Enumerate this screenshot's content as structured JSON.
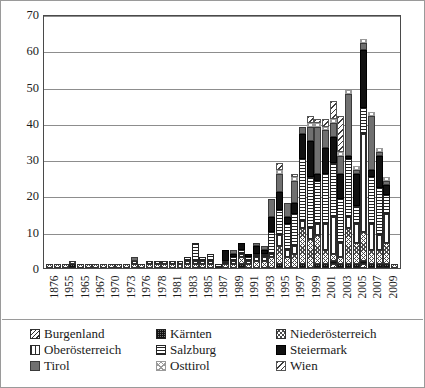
{
  "chart_data": {
    "type": "bar",
    "stacked": true,
    "title": "",
    "xlabel": "",
    "ylabel": "",
    "ylim": [
      0,
      70
    ],
    "yticks": [
      0,
      10,
      20,
      30,
      40,
      50,
      60,
      70
    ],
    "grid": true,
    "legend_position": "bottom",
    "legend_columns": 3,
    "categories": [
      "1876",
      "1955",
      "1963",
      "1965",
      "1966",
      "1967",
      "1968",
      "1970",
      "1971",
      "1973",
      "1975",
      "1976",
      "1977",
      "1978",
      "1980",
      "1981",
      "1982",
      "1983",
      "1984",
      "1985",
      "1986",
      "1987",
      "1988",
      "1989",
      "1990",
      "1991",
      "1992",
      "1993",
      "1994",
      "1995",
      "1996",
      "1997",
      "1998",
      "1999",
      "2000",
      "2001",
      "2002",
      "2003",
      "2004",
      "2005",
      "2006",
      "2007",
      "2008",
      "2009",
      "2010",
      "2011"
    ],
    "tick_labels": [
      "1876",
      "",
      "1955",
      "",
      "1965",
      "",
      "1967",
      "",
      "1970",
      "",
      "1973",
      "",
      "1976",
      "",
      "1978",
      "",
      "1981",
      "",
      "1983",
      "",
      "1985",
      "",
      "1987",
      "",
      "1989",
      "",
      "1991",
      "",
      "1993",
      "",
      "1995",
      "",
      "1997",
      "",
      "1999",
      "",
      "2001",
      "",
      "2003",
      "",
      "2005",
      "",
      "2007",
      "",
      "2009",
      "",
      "2011"
    ],
    "axis_tick_labels": [
      "1876",
      "1955",
      "1965",
      "1967",
      "1970",
      "1973",
      "1976",
      "1978",
      "1981",
      "1983",
      "1985",
      "1987",
      "1989",
      "1991",
      "1993",
      "1995",
      "1997",
      "1999",
      "2001",
      "2003",
      "2005",
      "2007",
      "2009",
      "2011"
    ],
    "series": [
      {
        "name": "Burgenland",
        "pattern": "p-burgenland",
        "values": [
          0,
          0,
          0,
          0,
          0,
          0,
          0,
          0,
          0,
          0,
          0,
          0,
          0,
          0,
          0,
          0,
          0,
          0,
          0,
          0,
          0,
          0,
          0,
          0,
          0,
          0,
          0,
          0,
          0,
          0,
          0,
          0,
          0,
          0,
          0,
          0,
          0,
          1,
          0,
          0,
          0,
          1,
          0,
          0,
          0,
          0
        ]
      },
      {
        "name": "Kärnten",
        "pattern": "p-kaernten",
        "values": [
          0,
          0,
          0,
          1,
          0,
          0,
          0,
          0,
          0,
          0,
          0,
          0,
          0,
          0,
          0,
          0,
          0,
          0,
          0,
          0,
          0,
          0,
          0,
          0,
          0,
          1,
          0,
          0,
          0,
          0,
          1,
          0,
          0,
          1,
          0,
          1,
          1,
          1,
          1,
          1,
          1,
          1,
          1,
          1,
          1,
          0
        ]
      },
      {
        "name": "Niederösterreich",
        "pattern": "p-niederoesterreich",
        "values": [
          1,
          1,
          1,
          1,
          1,
          1,
          1,
          1,
          1,
          1,
          1,
          1,
          1,
          1,
          1,
          1,
          1,
          1,
          1,
          1,
          1,
          1,
          0,
          1,
          1,
          2,
          1,
          2,
          2,
          3,
          5,
          3,
          4,
          10,
          8,
          8,
          4,
          2,
          2,
          10,
          6,
          8,
          4,
          4,
          6,
          1
        ]
      },
      {
        "name": "Oberösterreich",
        "pattern": "p-oberoesterreich",
        "values": [
          0,
          0,
          0,
          0,
          0,
          0,
          0,
          0,
          0,
          0,
          0,
          1,
          0,
          1,
          1,
          1,
          1,
          1,
          1,
          1,
          1,
          1,
          0,
          0,
          1,
          1,
          1,
          1,
          1,
          1,
          3,
          2,
          2,
          2,
          3,
          3,
          7,
          10,
          4,
          3,
          5,
          27,
          7,
          4,
          8,
          0
        ]
      },
      {
        "name": "Salzburg",
        "pattern": "p-salzburg",
        "values": [
          0,
          0,
          0,
          0,
          0,
          0,
          0,
          0,
          0,
          0,
          0,
          0,
          0,
          0,
          0,
          0,
          0,
          0,
          1,
          5,
          1,
          2,
          1,
          1,
          1,
          1,
          1,
          1,
          1,
          6,
          7,
          7,
          9,
          17,
          14,
          12,
          14,
          15,
          12,
          16,
          5,
          7,
          13,
          13,
          5,
          0
        ]
      },
      {
        "name": "Steiermark",
        "pattern": "p-steiermark",
        "values": [
          0,
          0,
          0,
          0,
          0,
          0,
          0,
          0,
          0,
          0,
          0,
          0,
          0,
          0,
          0,
          0,
          0,
          0,
          0,
          0,
          0,
          0,
          0,
          3,
          1,
          2,
          1,
          2,
          1,
          4,
          5,
          2,
          3,
          7,
          10,
          2,
          7,
          7,
          7,
          1,
          9,
          16,
          2,
          9,
          3,
          0
        ]
      },
      {
        "name": "Tirol",
        "pattern": "p-tirol",
        "values": [
          0,
          0,
          0,
          0,
          0,
          0,
          0,
          0,
          0,
          0,
          0,
          1,
          0,
          0,
          0,
          0,
          0,
          0,
          0,
          0,
          0,
          0,
          0,
          0,
          1,
          0,
          0,
          1,
          1,
          5,
          5,
          4,
          6,
          2,
          4,
          13,
          5,
          4,
          5,
          17,
          1,
          2,
          15,
          1,
          1,
          0
        ]
      },
      {
        "name": "Osttirol",
        "pattern": "p-osttirol",
        "values": [
          0,
          0,
          0,
          0,
          0,
          0,
          0,
          0,
          0,
          0,
          0,
          0,
          0,
          0,
          0,
          0,
          0,
          0,
          0,
          0,
          0,
          0,
          0,
          0,
          0,
          0,
          0,
          0,
          0,
          0,
          1,
          0,
          1,
          0,
          1,
          1,
          1,
          1,
          1,
          1,
          1,
          1,
          1,
          1,
          1,
          0
        ]
      },
      {
        "name": "Wien",
        "pattern": "p-wien",
        "values": [
          0,
          0,
          0,
          0,
          0,
          0,
          0,
          0,
          0,
          0,
          0,
          0,
          0,
          0,
          0,
          0,
          0,
          0,
          0,
          0,
          0,
          0,
          0,
          0,
          0,
          0,
          0,
          0,
          0,
          0,
          2,
          0,
          1,
          0,
          2,
          1,
          2,
          5,
          10,
          0,
          0,
          0,
          0,
          0,
          0,
          0
        ]
      }
    ],
    "totals": [
      1,
      1,
      1,
      2,
      1,
      1,
      1,
      1,
      1,
      1,
      1,
      3,
      1,
      2,
      2,
      3,
      3,
      3,
      7,
      7,
      4,
      4,
      1,
      6,
      6,
      8,
      6,
      14,
      10,
      20,
      29,
      18,
      26,
      39,
      44,
      41,
      48,
      43,
      49,
      28,
      63,
      42,
      33,
      24,
      2
    ]
  },
  "legend": {
    "items": [
      {
        "label": "Burgenland",
        "pattern": "p-burgenland"
      },
      {
        "label": "Kärnten",
        "pattern": "p-kaernten"
      },
      {
        "label": "Niederösterreich",
        "pattern": "p-niederoesterreich"
      },
      {
        "label": "Oberösterreich",
        "pattern": "p-oberoesterreich"
      },
      {
        "label": "Salzburg",
        "pattern": "p-salzburg"
      },
      {
        "label": "Steiermark",
        "pattern": "p-steiermark"
      },
      {
        "label": "Tirol",
        "pattern": "p-tirol"
      },
      {
        "label": "Osttirol",
        "pattern": "p-osttirol"
      },
      {
        "label": "Wien",
        "pattern": "p-wien"
      }
    ]
  },
  "colors": {
    "axis": "#4a4a4a",
    "grid": "#8d8d8d",
    "text": "#1b1b1b",
    "background": "#ffffff",
    "frame": "#9a9a9a"
  }
}
